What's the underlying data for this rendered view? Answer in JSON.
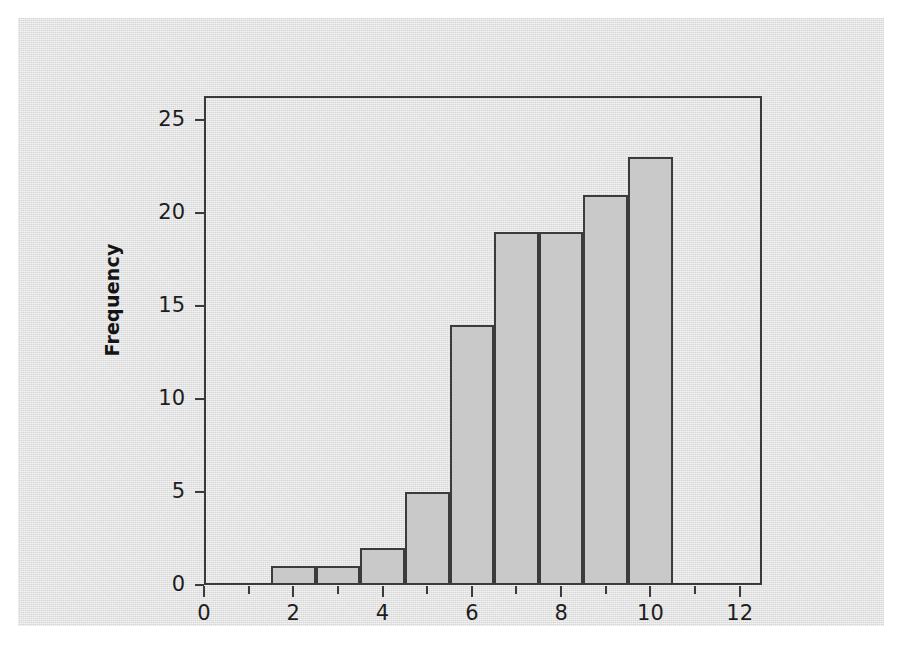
{
  "chart_data": {
    "type": "bar",
    "title": "",
    "xlabel": "",
    "ylabel": "Frequency",
    "categories": [
      "1.5-2.5",
      "2.5-3.5",
      "3.5-4.5",
      "4.5-5.5",
      "5.5-6.5",
      "6.5-7.5",
      "7.5-8.5",
      "8.5-9.5",
      "9.5-10.5"
    ],
    "bin_edges": [
      1.5,
      2.5,
      3.5,
      4.5,
      5.5,
      6.5,
      7.5,
      8.5,
      9.5,
      10.5
    ],
    "bin_centers": [
      2,
      3,
      4,
      5,
      6,
      7,
      8,
      9,
      10
    ],
    "values": [
      1,
      1,
      2,
      5,
      14,
      19,
      19,
      21,
      23
    ],
    "bin_width": 1,
    "xlim": [
      0,
      12.5
    ],
    "ylim": [
      0,
      26.3
    ],
    "grid": false,
    "legend": null,
    "bar_fill_color": "#c9c9c9",
    "bar_edge_color": "#3b3b3b",
    "plot_background_color": "#e2e2e2",
    "axis_color": "#3a3a3a",
    "x_axis": {
      "major_ticks": [
        0,
        2,
        4,
        6,
        8,
        10,
        12
      ],
      "major_tick_labels": [
        "0",
        "2",
        "4",
        "6",
        "8",
        "10",
        "12"
      ],
      "minor_ticks": [
        1,
        3,
        5,
        7,
        9,
        11
      ]
    },
    "y_axis": {
      "major_ticks": [
        0,
        5,
        10,
        15,
        20,
        25
      ],
      "major_tick_labels": [
        "0",
        "5",
        "10",
        "15",
        "20",
        "25"
      ]
    }
  }
}
